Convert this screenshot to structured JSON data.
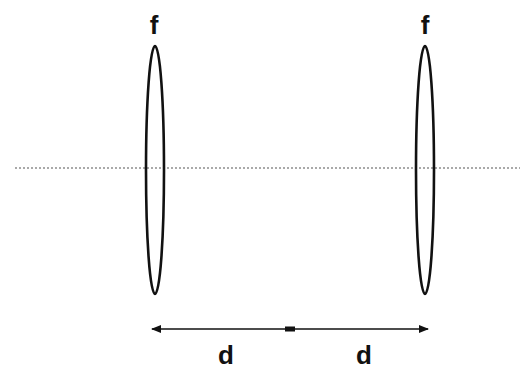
{
  "diagram": {
    "colors": {
      "stroke": "#111111",
      "axis": "#555555",
      "background": "#ffffff"
    },
    "optical_axis": {
      "x1": 15,
      "x2": 520,
      "y": 168,
      "style": "dotted"
    },
    "lenses": [
      {
        "id": "lens-1",
        "label": "f",
        "cx": 155,
        "cy": 170,
        "rx": 9,
        "ry": 124,
        "label_x": 154,
        "label_y": 12
      },
      {
        "id": "lens-2",
        "label": "f",
        "cx": 425,
        "cy": 170,
        "rx": 9,
        "ry": 124,
        "label_x": 425,
        "label_y": 12
      }
    ],
    "dimension": {
      "y": 329,
      "x_start": 150,
      "x_mid": 290,
      "x_end": 429,
      "segments": [
        {
          "label": "d",
          "label_x": 226,
          "label_y": 342
        },
        {
          "label": "d",
          "label_x": 364,
          "label_y": 342
        }
      ]
    }
  }
}
